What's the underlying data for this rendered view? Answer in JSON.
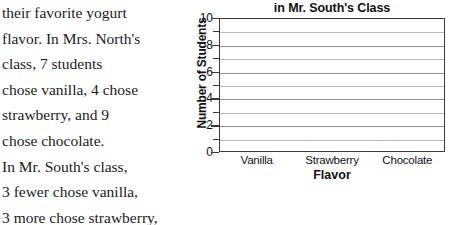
{
  "problem": {
    "lines": [
      "their favorite yogurt",
      "flavor. In Mrs. North's",
      "class, 7 students",
      "chose vanilla, 4 chose",
      "strawberry, and 9",
      "chose chocolate.",
      "In Mr. South's class,",
      "3 fewer chose vanilla,",
      "3 more chose strawberry,",
      "and 5 fewer chose chocolate. Which flavor was most"
    ]
  },
  "chart_data": {
    "type": "bar",
    "title": "in Mr. South's Class",
    "xlabel": "Flavor",
    "ylabel": "Number of Students",
    "categories": [
      "Vanilla",
      "Strawberry",
      "Chocolate"
    ],
    "values": [
      null,
      null,
      null
    ],
    "ylim": [
      0,
      10
    ],
    "ytick_labels": [
      "0",
      "2",
      "4",
      "6",
      "8",
      "10"
    ],
    "ytick_values": [
      0,
      2,
      4,
      6,
      8,
      10
    ],
    "gridline_values": [
      1,
      2,
      3,
      4,
      5,
      6,
      7,
      8,
      9
    ],
    "grid": true,
    "legend": "none",
    "note": "empty grid; no bars drawn"
  },
  "colors": {
    "text": "#1b1b1b",
    "axis": "#3a3a3a",
    "gridline": "#b8b8b8",
    "gridline_major": "#8e8e8e",
    "background": "#ffffff"
  }
}
